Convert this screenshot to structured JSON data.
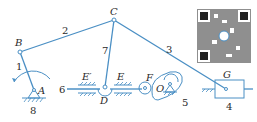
{
  "diagram": {
    "type": "mechanism-kinematic-sketch",
    "joint_labels": {
      "A": "A",
      "B": "B",
      "C": "C",
      "D": "D",
      "E": "E",
      "E_prime": "E′",
      "F": "F",
      "G": "G",
      "O": "O"
    },
    "link_numbers": {
      "n1": "1",
      "n2": "2",
      "n3": "3",
      "n4": "4",
      "n5": "5",
      "n6": "6",
      "n7": "7",
      "n8": "8"
    },
    "colors": {
      "line": "#4a8fc4",
      "text": "#2a2a2a",
      "background": "#ffffff"
    },
    "qr_code": {
      "present": true
    }
  }
}
